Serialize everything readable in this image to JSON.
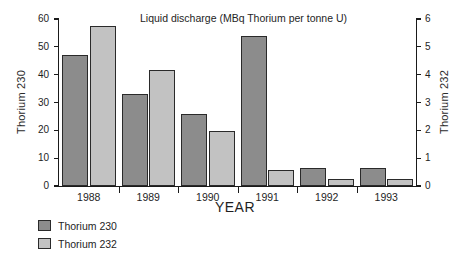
{
  "chart_data": {
    "type": "bar",
    "title": "Liquid discharge (MBq Thorium per tonne U)",
    "xlabel": "YEAR",
    "ylabel": "Thorium 230",
    "y2label": "Thorium 232",
    "categories": [
      "1988",
      "1989",
      "1990",
      "1991",
      "1992",
      "1993"
    ],
    "series": [
      {
        "name": "Thorium 230",
        "axis": "left",
        "color": "#8c8c8c",
        "values": [
          47,
          33,
          26,
          54,
          6.5,
          6.4
        ]
      },
      {
        "name": "Thorium 232",
        "axis": "right",
        "color": "#c2c2c2",
        "values": [
          5.75,
          4.18,
          1.98,
          0.58,
          0.26,
          0.25
        ]
      }
    ],
    "ylim": [
      0,
      60
    ],
    "y2lim": [
      0,
      6
    ],
    "yticks": [
      0,
      10,
      20,
      30,
      40,
      50,
      60
    ],
    "y2ticks": [
      0,
      1,
      2,
      3,
      4,
      5,
      6
    ],
    "ytick_labels": [
      "0",
      "10",
      "20",
      "30",
      "40",
      "50",
      "60"
    ],
    "y2tick_labels": [
      "0",
      "1",
      "2",
      "3",
      "4",
      "5",
      "6"
    ],
    "grid": false,
    "legend_position": "below-left"
  },
  "legend": {
    "items": [
      {
        "label": "Thorium 230",
        "swatch": "s230"
      },
      {
        "label": "Thorium 232",
        "swatch": "s232"
      }
    ]
  }
}
